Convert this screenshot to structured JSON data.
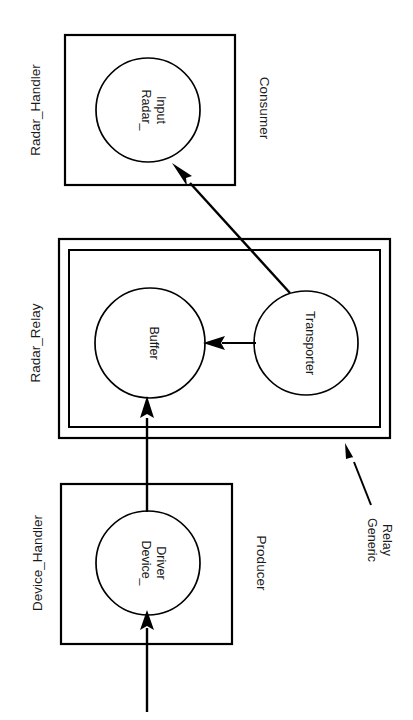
{
  "diagram": {
    "type": "rotated-block-diagram",
    "orientation_degrees": 90,
    "title": "",
    "groups": [
      {
        "id": "radar-handler",
        "label": "Radar_Handler",
        "role_label": "Consumer",
        "node": "Radar_\nInput",
        "node_line1": "Radar_",
        "node_line2": "Input"
      },
      {
        "id": "radar-relay",
        "label": "Radar_Relay",
        "role_label": "",
        "nodes": [
          {
            "id": "buffer",
            "label": "Buffer"
          },
          {
            "id": "transporter",
            "label": "Transporter"
          }
        ]
      },
      {
        "id": "device-handler",
        "label": "Device_Handler",
        "role_label": "Producer",
        "node": "Device_\nDriver",
        "node_line1": "Device_",
        "node_line2": "Driver"
      }
    ],
    "annotations": [
      {
        "id": "generic-relay",
        "line1": "Generic",
        "line2": "Relay"
      }
    ],
    "edges": [
      {
        "from": "external-input",
        "to": "device-driver"
      },
      {
        "from": "device-driver",
        "to": "buffer"
      },
      {
        "from": "transporter",
        "to": "buffer"
      },
      {
        "from": "transporter",
        "to": "radar-input"
      }
    ],
    "colors": {
      "stroke": "#000000",
      "text": "#1a1a1a",
      "background": "#ffffff"
    }
  }
}
